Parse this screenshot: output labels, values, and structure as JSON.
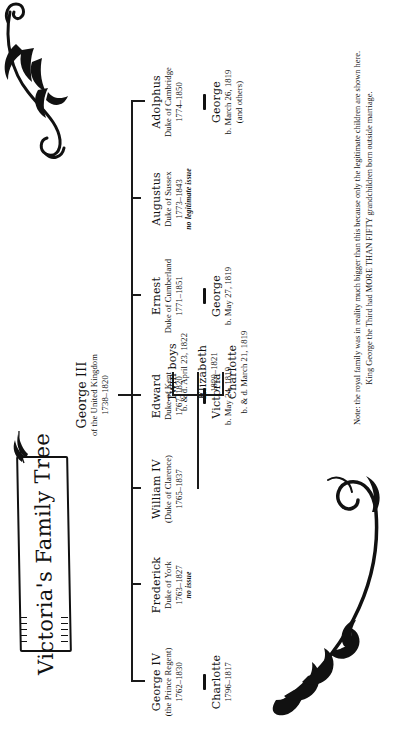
{
  "title": {
    "text": "Victoria's Family Tree"
  },
  "root": {
    "name": "George III",
    "line1": "of the United Kingdom",
    "line2": "1738–1820"
  },
  "children": [
    {
      "name": "George IV",
      "line1": "(the Prince Regent)",
      "line2": "1762–1830",
      "note": ""
    },
    {
      "name": "Frederick",
      "line1": "Duke of York",
      "line2": "1763–1827",
      "note": "no issue"
    },
    {
      "name": "William IV",
      "line1": "(Duke of Clarence)",
      "line2": "1765–1837",
      "note": ""
    },
    {
      "name": "Edward",
      "line1": "Duke of Kent",
      "line2": "1767–1820",
      "note": ""
    },
    {
      "name": "Ernest",
      "line1": "Duke of Cumberland",
      "line2": "1771–1851",
      "note": ""
    },
    {
      "name": "Augustus",
      "line1": "Duke of Sussex",
      "line2": "1773–1843",
      "note": "no legitimate issue"
    },
    {
      "name": "Adolphus",
      "line1": "Duke of Cambridge",
      "line2": "1774–1850",
      "note": ""
    }
  ],
  "grandchildren": {
    "george_iv": [
      {
        "name": "Charlotte",
        "line1": "1796–1817",
        "line2": ""
      }
    ],
    "william_iv": [
      {
        "name": "Charlotte",
        "line1": "b. & d. March 21, 1819",
        "line2": ""
      },
      {
        "name": "Elizabeth",
        "line1": "1820–1821",
        "line2": ""
      },
      {
        "name": "Twin boys",
        "line1": "b. & d. April 23, 1822",
        "line2": ""
      }
    ],
    "edward": [
      {
        "name": "Victoria",
        "line1": "b. May 24, 1819",
        "line2": ""
      }
    ],
    "ernest": [
      {
        "name": "George",
        "line1": "b. May 27, 1819",
        "line2": ""
      }
    ],
    "adolphus": [
      {
        "name": "George",
        "line1": "b. March 26, 1819",
        "line2": "(and others)"
      }
    ]
  },
  "note": {
    "line1": "Note: the royal family was in reality much bigger than this because only the legitimate children are shown here.",
    "line2": "King George the Third had MORE THAN FIFTY grandchildren born outside marriage."
  },
  "icons": {
    "top_flourish": "leafy-vine-flourish",
    "bottom_flourish": "leafy-swash-flourish",
    "banner_flourish": "banner-leaf-flourish"
  },
  "colors": {
    "ink": "#111111",
    "paper": "#ffffff"
  }
}
